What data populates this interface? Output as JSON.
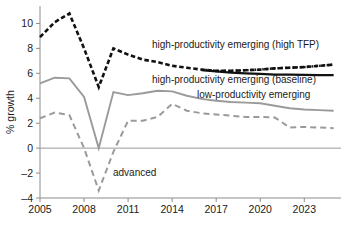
{
  "chart_data": {
    "type": "line",
    "title": "",
    "xlabel": "",
    "ylabel": "% growth",
    "xlim": [
      2005,
      2025.5
    ],
    "ylim": [
      -4,
      11.4
    ],
    "yticks": [
      -4,
      -2,
      0,
      2,
      4,
      6,
      8,
      10
    ],
    "ytick_labels": [
      "–4",
      "–2",
      "0",
      "2",
      "4",
      "6",
      "8",
      "10"
    ],
    "xticks": [
      2005,
      2008,
      2011,
      2014,
      2017,
      2020,
      2023
    ],
    "xtick_labels": [
      "2005",
      "2008",
      "2011",
      "2014",
      "2017",
      "2020",
      "2023"
    ],
    "grid": false,
    "zero_line": true,
    "legend_position": "inline-annotations",
    "x": [
      2005,
      2006,
      2007,
      2008,
      2009,
      2010,
      2011,
      2012,
      2013,
      2014,
      2015,
      2016,
      2017,
      2018,
      2019,
      2020,
      2021,
      2022,
      2023,
      2024,
      2025
    ],
    "series": [
      {
        "name": "high-productivity emerging  (high TFP)",
        "label": "high-productivity emerging  (high TFP)",
        "color": "#111111",
        "style": "dashed",
        "values": [
          8.9,
          10.1,
          10.8,
          8.0,
          4.9,
          8.0,
          7.5,
          7.1,
          6.9,
          6.6,
          6.45,
          6.3,
          6.2,
          6.2,
          6.25,
          6.3,
          6.4,
          6.45,
          6.5,
          6.6,
          6.7
        ]
      },
      {
        "name": "high-productivity emerging (baseline)",
        "label": "high-productivity emerging (baseline)",
        "color": "#111111",
        "style": "solid",
        "values": [
          null,
          null,
          null,
          null,
          null,
          null,
          null,
          null,
          null,
          null,
          null,
          6.25,
          6.15,
          6.05,
          6.0,
          5.95,
          5.9,
          5.9,
          5.88,
          5.86,
          5.85
        ]
      },
      {
        "name": "low-productivity emerging",
        "label": "low-productivity emerging",
        "color": "#9a9a9a",
        "style": "solid",
        "values": [
          5.2,
          5.65,
          5.6,
          4.1,
          0.0,
          4.5,
          4.25,
          4.4,
          4.6,
          4.55,
          4.2,
          3.95,
          3.8,
          3.7,
          3.65,
          3.6,
          3.4,
          3.2,
          3.1,
          3.05,
          3.0
        ]
      },
      {
        "name": "advanced",
        "label": "advanced",
        "color": "#9a9a9a",
        "style": "dashed",
        "values": [
          2.4,
          2.85,
          2.65,
          0.0,
          -3.4,
          -0.3,
          2.2,
          2.2,
          2.5,
          3.55,
          3.0,
          2.8,
          2.7,
          2.6,
          2.5,
          2.5,
          2.45,
          1.65,
          1.7,
          1.65,
          1.6
        ]
      }
    ],
    "annotations": [
      {
        "text": "high-productivity emerging  (high TFP)",
        "x_px": 152,
        "y_px": 48
      },
      {
        "text": "high-productivity emerging (baseline)",
        "x_px": 152,
        "y_px": 83
      },
      {
        "text": "low-productivity emerging",
        "x_px": 197,
        "y_px": 98
      },
      {
        "text": "advanced",
        "x_px": 113,
        "y_px": 176
      }
    ]
  },
  "colors": {
    "black_series": "#111111",
    "gray_series": "#9a9a9a",
    "axis": "#8c8c8c",
    "background": "#ffffff",
    "text": "#1a1a1a"
  }
}
